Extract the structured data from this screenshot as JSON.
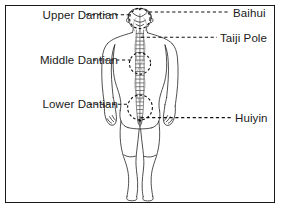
{
  "figure": {
    "view": "posterior (back) view of human body",
    "border_color": "#1a1a1a",
    "background_color": "#ffffff",
    "line_color": "#1a1a1a",
    "body_outline_color": "#222222"
  },
  "labels": {
    "left": [
      {
        "id": "upper-dantian",
        "text": "Upper Dantian",
        "target": "head / crown region",
        "marker": "dashed-circle"
      },
      {
        "id": "middle-dantian",
        "text": "Middle Dantian",
        "target": "chest / heart region",
        "marker": "dashed-circle"
      },
      {
        "id": "lower-dantian",
        "text": "Lower Dantian",
        "target": "lower abdomen region",
        "marker": "dashed-circle"
      }
    ],
    "right": [
      {
        "id": "baihui",
        "text": "Baihui",
        "target": "crown of head",
        "marker": "point"
      },
      {
        "id": "taiji-pole",
        "text": "Taiji Pole",
        "target": "central vertical channel",
        "marker": "point"
      },
      {
        "id": "huiyin",
        "text": "Huiyin",
        "target": "perineum",
        "marker": "point"
      }
    ]
  },
  "annotations": {
    "leader_line_style": "dashed",
    "dashed_circles": 3,
    "central_channel": "Taiji Pole runs vertically from Baihui to Huiyin"
  }
}
